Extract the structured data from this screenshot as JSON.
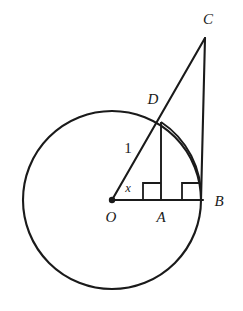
{
  "figure": {
    "kind": "circle-tangent-geometry-diagram",
    "background_color": "#ffffff",
    "stroke_color": "#1a1a1a",
    "width": 243,
    "height": 311,
    "circle": {
      "center_label": "O",
      "center_x": 112,
      "center_y": 200,
      "radius_px": 89,
      "radius_label": "1"
    },
    "points": [
      {
        "label": "C",
        "x": 205,
        "y": 38,
        "label_x": 208,
        "label_y": 21
      },
      {
        "label": "D",
        "x": 161,
        "y": 122,
        "label_x": 153,
        "label_y": 101
      },
      {
        "label": "B",
        "x": 201,
        "y": 200,
        "label_x": 219,
        "label_y": 203
      },
      {
        "label": "A",
        "x": 161,
        "y": 200,
        "label_x": 161,
        "label_y": 219
      },
      {
        "label": "O",
        "x": 112,
        "y": 200,
        "label_x": 111,
        "label_y": 219
      }
    ],
    "labels": {
      "point_c": "C",
      "point_d": "D",
      "point_b": "B",
      "point_a": "A",
      "point_o": "O",
      "radius": "1",
      "angle": "x"
    },
    "radius_label_position": {
      "x": 128,
      "y": 150
    },
    "angle_label_position": {
      "x": 128,
      "y": 189
    },
    "segments": [
      {
        "name": "radius-O-to-D-extended-to-C",
        "from": "O",
        "to": "C"
      },
      {
        "name": "tangent-B-to-C",
        "from": "B",
        "to": "C"
      },
      {
        "name": "horizontal-O-to-B",
        "from": "O",
        "to": "B"
      },
      {
        "name": "perpendicular-D-to-A",
        "from": "D",
        "to": "A"
      }
    ],
    "arc": {
      "name": "arc-D-to-B",
      "from": "D",
      "to": "B",
      "center": "O"
    },
    "right_angle_marks": [
      {
        "name": "right-angle-at-A",
        "x": 143,
        "y": 183,
        "size": 18
      },
      {
        "name": "right-angle-at-B",
        "x": 182,
        "y": 183,
        "size": 18
      }
    ]
  }
}
